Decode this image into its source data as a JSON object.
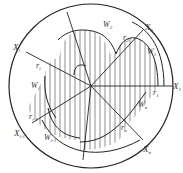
{
  "diagram": {
    "colors": {
      "stroke": "#222222",
      "hatch": "#444444",
      "text": "#333333",
      "background": "#ffffff"
    },
    "outer_circle": {
      "cx": 91,
      "cy": 86,
      "r": 82
    },
    "labels": {
      "X1": {
        "main": "X",
        "sub": "1"
      },
      "X2": {
        "main": "X",
        "sub": "2"
      },
      "Xi": {
        "main": "X",
        "sub": "i"
      },
      "Xi_1": {
        "main": "X",
        "sub": "i-1"
      },
      "Xn": {
        "main": "X",
        "sub": "n"
      },
      "W1": {
        "main": "W",
        "sub": "1"
      },
      "W2": {
        "main": "W",
        "sub": "2"
      },
      "Wi": {
        "main": "W",
        "sub": "i"
      },
      "Wi_1": {
        "main": "W",
        "sub": "i-1"
      },
      "Wn": {
        "main": "W",
        "sub": "n"
      },
      "r1": {
        "main": "r",
        "sub": "1"
      },
      "r2": {
        "main": "r",
        "sub": "2"
      },
      "ri": {
        "main": "r",
        "sub": "i"
      },
      "ri_1": {
        "main": "r",
        "sub": "i-1"
      },
      "rn": {
        "main": "r",
        "sub": "n"
      }
    }
  }
}
